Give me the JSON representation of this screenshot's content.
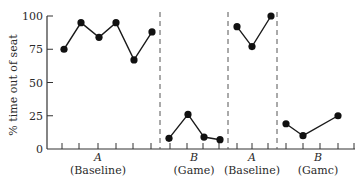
{
  "chart_data": {
    "type": "line",
    "title": "",
    "xlabel": "",
    "ylabel": "% time out of seat",
    "ylim": [
      0,
      100
    ],
    "yticks": [
      0,
      25,
      50,
      75,
      100
    ],
    "grid": false,
    "legend": null,
    "phases": [
      {
        "letter": "A",
        "name": "(Baseline)",
        "values": [
          75,
          95,
          84,
          95,
          67,
          88
        ]
      },
      {
        "letter": "B",
        "name": "(Game)",
        "values": [
          8,
          26,
          9,
          7
        ]
      },
      {
        "letter": "A",
        "name": "(Baseline)",
        "values": [
          92,
          77,
          100
        ]
      },
      {
        "letter": "B",
        "name": "(Gamc)",
        "values": [
          19,
          10,
          25
        ]
      }
    ],
    "series": [
      {
        "name": "Phase A (Baseline) 1",
        "x": [
          1,
          2,
          3,
          4,
          5,
          6
        ],
        "values": [
          75,
          95,
          84,
          95,
          67,
          88
        ]
      },
      {
        "name": "Phase B (Game) 1",
        "x": [
          7,
          8,
          9,
          10
        ],
        "values": [
          8,
          26,
          9,
          7
        ]
      },
      {
        "name": "Phase A (Baseline) 2",
        "x": [
          11,
          12,
          13
        ],
        "values": [
          92,
          77,
          100
        ]
      },
      {
        "name": "Phase B (Game) 2",
        "x": [
          14,
          15,
          16,
          17
        ],
        "values": [
          19,
          10,
          null,
          25
        ]
      }
    ],
    "phase_dividers": "dashed vertical lines between phases"
  },
  "colors": {
    "line": "#1a1a1a",
    "marker": "#111111",
    "axis": "#333333",
    "divider": "#555555",
    "text": "#2a2a2a"
  }
}
